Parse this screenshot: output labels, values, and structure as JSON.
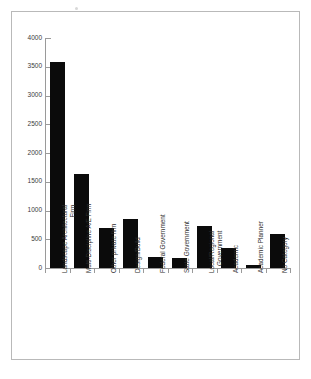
{
  "figure": {
    "frame_color": "#b9b9b9",
    "bar_color": "#0b0b0b",
    "axis_color": "#9a9a9a",
    "background": "#ffffff"
  },
  "chart_data": {
    "type": "bar",
    "title": "",
    "subtitle": "",
    "xlabel": "",
    "ylabel": "",
    "ylim": [
      0,
      4000
    ],
    "ytick_step": 500,
    "grid": false,
    "legend": false,
    "orientation": "vertical",
    "categories": [
      "Landscape Architectural Firm",
      "Multi-Discipline A/E Firm",
      "Other private firm",
      "Design/Build",
      "Federal Government",
      "State Government",
      "Local/Regional Government",
      "Academic",
      "Academic Planner",
      "No Category"
    ],
    "category_lines": [
      [
        "Landscape Architectural",
        "Firm"
      ],
      [
        "Multi-Discipline A/E Firm"
      ],
      [
        "Other private firm"
      ],
      [
        "Design/Build"
      ],
      [
        "Federal Government"
      ],
      [
        "State Government"
      ],
      [
        "Local/Regional",
        "Government"
      ],
      [
        "Academic"
      ],
      [
        "Academic Planner"
      ],
      [
        "No Category"
      ]
    ],
    "values": [
      3580,
      1640,
      700,
      845,
      200,
      170,
      730,
      350,
      60,
      590
    ],
    "yticks": [
      0,
      500,
      1000,
      1500,
      2000,
      2500,
      3000,
      3500,
      4000
    ],
    "ytick_labels": [
      "0",
      "500",
      "1000",
      "1500",
      "2000",
      "2500",
      "3000",
      "3500",
      "4000"
    ]
  }
}
